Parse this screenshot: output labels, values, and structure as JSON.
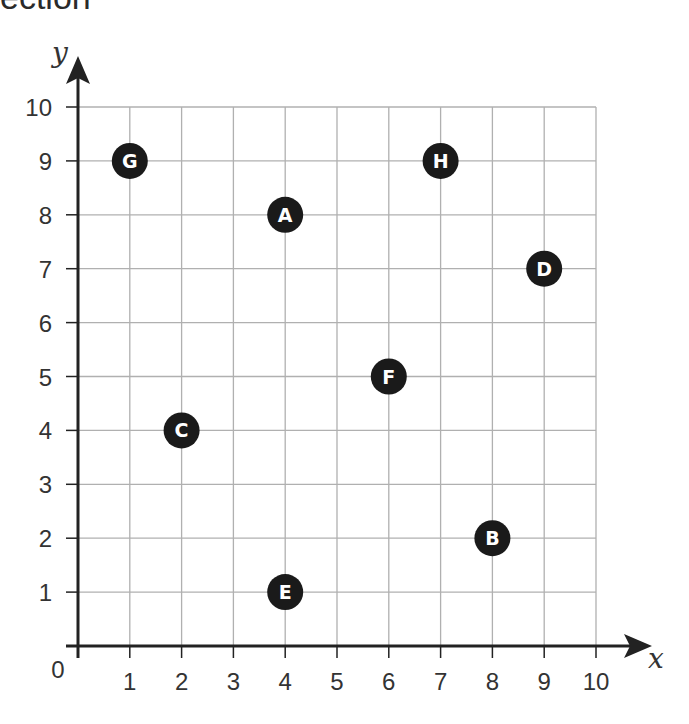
{
  "heading_fragment": "ection",
  "chart_data": {
    "type": "scatter",
    "title": "",
    "xlabel": "x",
    "ylabel": "y",
    "xlim": [
      0,
      10
    ],
    "ylim": [
      0,
      10
    ],
    "grid": true,
    "x_ticks": [
      "1",
      "2",
      "3",
      "4",
      "5",
      "6",
      "7",
      "8",
      "9",
      "10"
    ],
    "y_ticks": [
      "1",
      "2",
      "3",
      "4",
      "5",
      "6",
      "7",
      "8",
      "9",
      "10"
    ],
    "origin_label": "0",
    "points": [
      {
        "label": "A",
        "x": 4,
        "y": 8
      },
      {
        "label": "B",
        "x": 8,
        "y": 2
      },
      {
        "label": "C",
        "x": 2,
        "y": 4
      },
      {
        "label": "D",
        "x": 9,
        "y": 7
      },
      {
        "label": "E",
        "x": 4,
        "y": 1
      },
      {
        "label": "F",
        "x": 6,
        "y": 5
      },
      {
        "label": "G",
        "x": 1,
        "y": 9
      },
      {
        "label": "H",
        "x": 7,
        "y": 9
      }
    ],
    "colors": {
      "point_fill": "#1a1a1a",
      "point_text": "#ffffff",
      "grid": "#b0b0b0",
      "axis": "#222222"
    }
  }
}
